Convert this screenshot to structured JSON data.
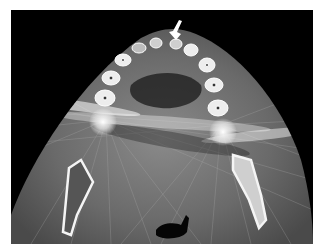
{
  "figure": {
    "caption_label": "",
    "modality": "Axial CT slice",
    "annotations": [
      {
        "type": "arrow",
        "color": "#ffffff",
        "direction": "down-left",
        "points_to": "anterior tooth region"
      }
    ],
    "colors": {
      "background": "#000000",
      "soft_tissue": "#6e6e6e",
      "bone": "#f2f2f2",
      "air": "#050505"
    }
  }
}
